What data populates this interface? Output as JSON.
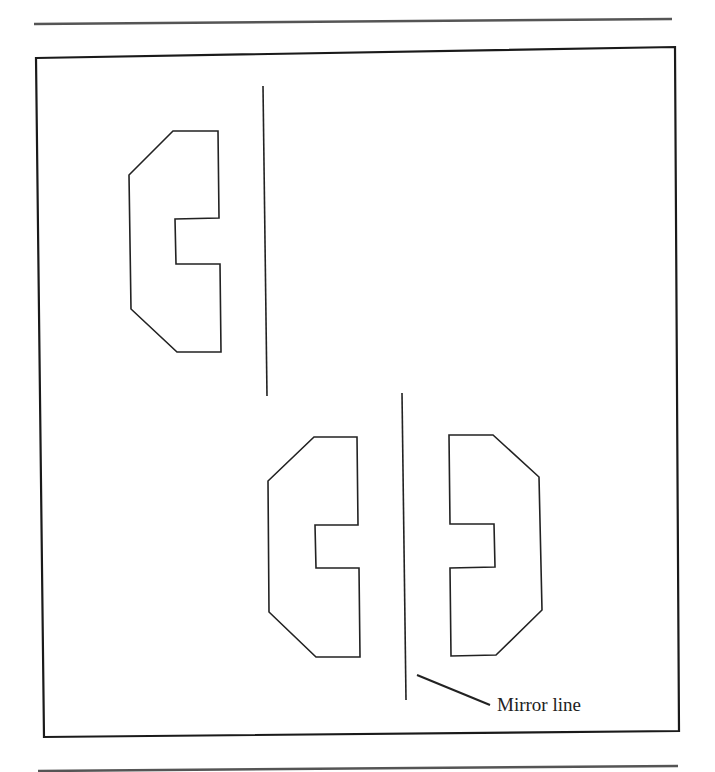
{
  "diagram": {
    "annotation_label": "Mirror line",
    "stroke_color": "#222222",
    "background": "#ffffff",
    "rules": [
      {
        "x1": 34,
        "y1": 24,
        "x2": 672,
        "y2": 19
      },
      {
        "x1": 38,
        "y1": 771,
        "x2": 678,
        "y2": 766
      }
    ],
    "frame": {
      "points": "36,58 675,47 679,731 44,737"
    },
    "shapes": {
      "original": {
        "points": "173,131 218,131 219,218 175,219 176,264 220,264 221,352 177,352 131,309 129,175"
      },
      "original_mirror_line": {
        "x1": 263,
        "y1": 86,
        "x2": 267,
        "y2": 396
      },
      "reflect_left": {
        "points": "314,437 357,437 358,525 315,525 316,568 359,568 360,657 316,657 269,612 268,481"
      },
      "mirror_line": {
        "x1": 402,
        "y1": 393,
        "x2": 406,
        "y2": 700
      },
      "reflect_right": {
        "points": "449,435 493,435 539,477 542,610 496,655 451,656 450,568 495,567 494,524 450,524"
      },
      "leader": {
        "x1": 417,
        "y1": 675,
        "x2": 490,
        "y2": 705
      }
    },
    "label_pos": {
      "x": 497,
      "y": 711
    }
  }
}
